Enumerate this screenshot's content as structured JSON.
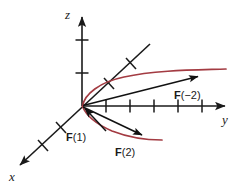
{
  "figure": {
    "background_color": "#ffffff",
    "axis_color": "#1a1a1a",
    "curve_color": "#a33b42",
    "vector_color": "#111111"
  },
  "axes": [
    {
      "id": "z-axis",
      "label": "z",
      "direction": "up",
      "tick_count": 2,
      "origin": {
        "x": 82,
        "y": 106
      },
      "tip": {
        "x": 82,
        "y": 14
      }
    },
    {
      "id": "y-axis",
      "label": "y",
      "direction": "right",
      "tick_count": 5,
      "origin": {
        "x": 82,
        "y": 106
      },
      "tip": {
        "x": 228,
        "y": 106
      }
    },
    {
      "id": "x-axis",
      "label": "x",
      "direction": "down-left",
      "tick_count": 6,
      "origin": {
        "x": 82,
        "y": 106
      },
      "tip": {
        "x": 17,
        "y": 168
      },
      "back_tip": {
        "x": 150,
        "y": 44
      }
    }
  ],
  "curves": [
    {
      "id": "upper-curve",
      "color": "#a33b42",
      "description": "upper branch of the parabolic space curve running from the origin toward the upper right"
    },
    {
      "id": "lower-curve",
      "color": "#a33b42",
      "description": "lower branch of the parabolic space curve running from the origin toward the lower right"
    }
  ],
  "vectors": [
    {
      "id": "vector-f-minus-2",
      "label": "F(−2)",
      "label_bold_part": "F",
      "label_rest": "(−2)",
      "label_pos": {
        "x": 175,
        "y": 96
      },
      "from": {
        "x": 82,
        "y": 106
      },
      "to": {
        "x": 202,
        "y": 75
      }
    },
    {
      "id": "vector-f-1",
      "label": "F(1)",
      "label_bold_part": "F",
      "label_rest": "(1)",
      "label_pos": {
        "x": 70,
        "y": 137
      },
      "from": {
        "x": 104,
        "y": 129
      },
      "to": {
        "x": 84,
        "y": 108
      }
    },
    {
      "id": "vector-f-2",
      "label": "F(2)",
      "label_bold_part": "F",
      "label_rest": "(2)",
      "label_pos": {
        "x": 118,
        "y": 152
      },
      "from": {
        "x": 82,
        "y": 106
      },
      "to": {
        "x": 146,
        "y": 137
      }
    }
  ]
}
